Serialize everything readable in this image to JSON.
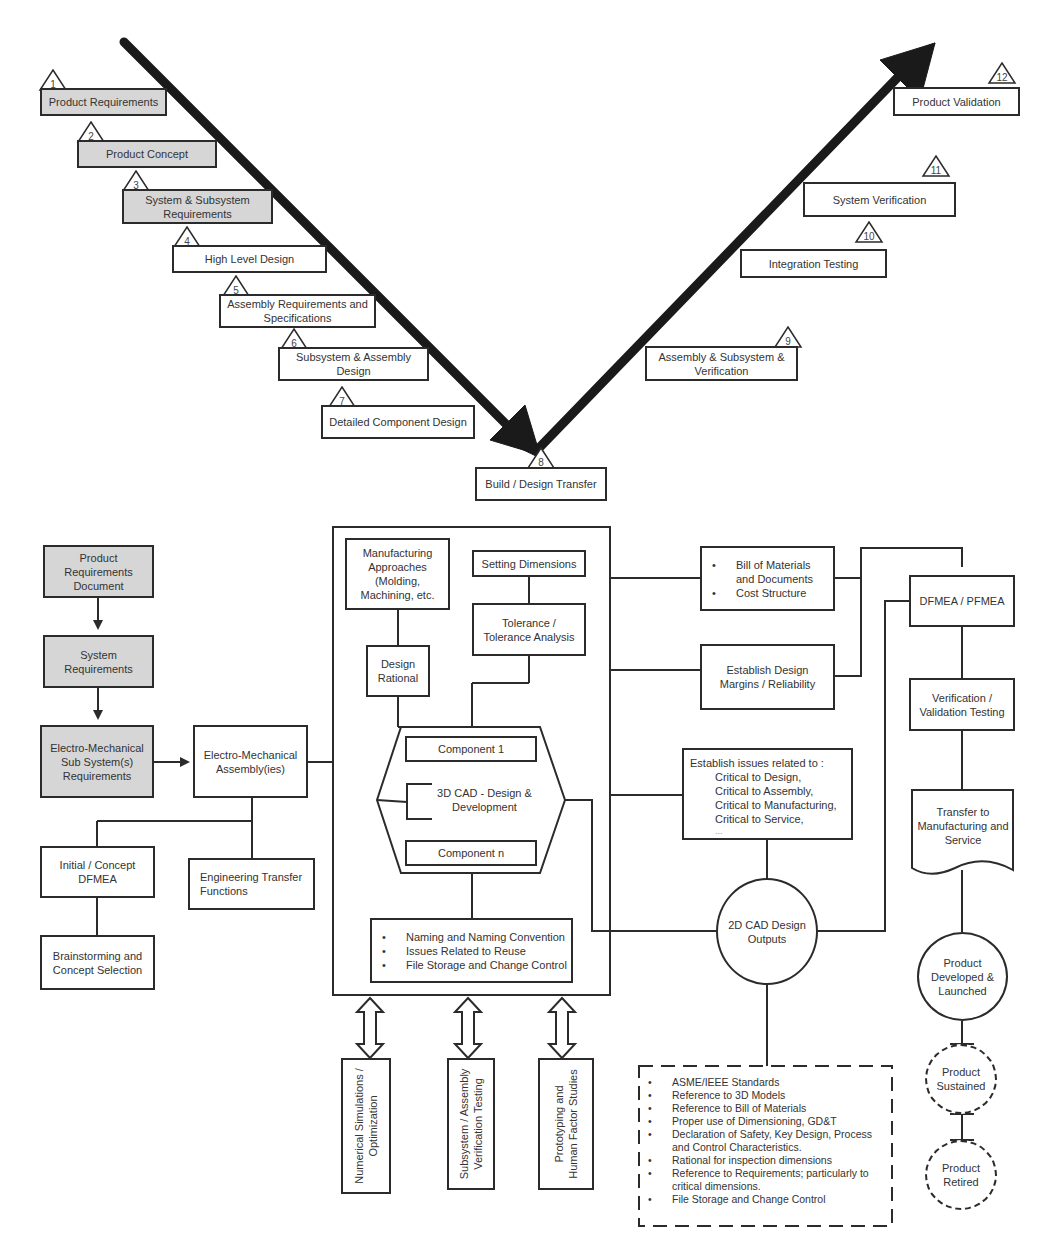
{
  "v_model": {
    "left_leg": [
      {
        "num": "1",
        "label": "Product Requirements",
        "shaded": true
      },
      {
        "num": "2",
        "label": "Product Concept",
        "shaded": true
      },
      {
        "num": "3",
        "label": "System & Subsystem Requirements",
        "shaded": true
      },
      {
        "num": "4",
        "label": "High Level Design",
        "shaded": false
      },
      {
        "num": "5",
        "label": "Assembly Requirements and Specifications",
        "shaded": false
      },
      {
        "num": "6",
        "label": "Subsystem & Assembly Design",
        "shaded": false
      },
      {
        "num": "7",
        "label": "Detailed Component Design",
        "shaded": false
      }
    ],
    "bottom": {
      "num": "8",
      "label": "Build / Design Transfer"
    },
    "right_leg": [
      {
        "num": "9",
        "label": "Assembly & Subsystem & Verification"
      },
      {
        "num": "10",
        "label": "Integration Testing"
      },
      {
        "num": "11",
        "label": "System Verification"
      },
      {
        "num": "12",
        "label": "Product Validation"
      }
    ]
  },
  "flow": {
    "requirements_chain": [
      {
        "label": "Product Requirements Document"
      },
      {
        "label": "System Requirements"
      },
      {
        "label": "Electro-Mechanical Sub System(s) Requirements"
      }
    ],
    "assembly": "Electro-Mechanical Assembly(ies)",
    "concept_dfmea": "Initial / Concept DFMEA",
    "brainstorming": "Brainstorming and Concept Selection",
    "engineering_transfer": "Engineering Transfer Functions",
    "design_frame": {
      "manufacturing_approaches": "Manufacturing Approaches (Molding, Machining, etc.",
      "design_rational": "Design Rational",
      "setting_dimensions": "Setting Dimensions",
      "tolerance": "Tolerance / Tolerance Analysis",
      "cad_3d": {
        "title": "3D CAD - Design & Development",
        "component_first": "Component 1",
        "component_last": "Component n"
      },
      "cad_notes": [
        "Naming and Naming Convention",
        "Issues Related to Reuse",
        "File Storage and Change Control"
      ]
    },
    "support_activities": [
      "Numerical Simulations /\nOptimization",
      "Subsystem / Assembly\nVerification Testing",
      "Prototyping and\nHuman Factor Studies"
    ],
    "bom": [
      "Bill of Materials and Documents",
      "Cost Structure"
    ],
    "design_margins": "Establish Design Margins / Reliability",
    "critical_issues": {
      "intro": "Establish issues related to :",
      "items": [
        "Critical to Design,",
        "Critical to Assembly,",
        "Critical to Manufacturing,",
        "Critical to Service,",
        "..."
      ]
    },
    "cad_2d": "2D CAD Design Outputs",
    "cad_2d_notes": [
      "ASME/IEEE Standards",
      "Reference to 3D Models",
      "Reference to Bill of Materials",
      "Proper use of Dimensioning, GD&T",
      "Declaration of Safety, Key Design, Process and Control Characteristics.",
      "Rational for inspection dimensions",
      "Reference to Requirements; particularly to critical dimensions.",
      "File Storage and Change Control"
    ],
    "right_chain": {
      "fmea": "DFMEA / PFMEA",
      "vv_testing": "Verification / Validation Testing",
      "transfer": "Transfer to Manufacturing and Service",
      "launched": "Product Developed & Launched",
      "sustained": "Product Sustained",
      "retired": "Product Retired"
    }
  },
  "colors": {
    "line": "#2b2b2b",
    "shaded_box": "#d6d6d6",
    "background": "#ffffff"
  }
}
